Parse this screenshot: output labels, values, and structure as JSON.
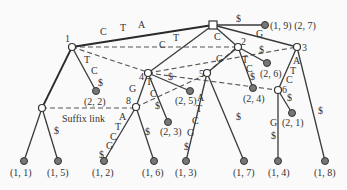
{
  "diagram": {
    "type": "generalized-suffix-tree",
    "root": {
      "id": "root",
      "shape": "square"
    },
    "internal_nodes": [
      {
        "id": "n1",
        "label": "1"
      },
      {
        "id": "n2",
        "label": "2"
      },
      {
        "id": "n3",
        "label": "3"
      },
      {
        "id": "n4",
        "label": "4"
      },
      {
        "id": "n5",
        "label": "5"
      },
      {
        "id": "n6",
        "label": "6"
      },
      {
        "id": "n8",
        "label": "8"
      },
      {
        "id": "nL",
        "label": ""
      }
    ],
    "leaves": [
      {
        "id": "l19",
        "label": "(1, 9) (2, 7)"
      },
      {
        "id": "l22",
        "label": "(2, 2)"
      },
      {
        "id": "l25",
        "label": "(2, 5)"
      },
      {
        "id": "l23",
        "label": "(2, 3)"
      },
      {
        "id": "l26",
        "label": "(2, 6)"
      },
      {
        "id": "l24",
        "label": "(2, 4)"
      },
      {
        "id": "l21",
        "label": "(2, 1)"
      },
      {
        "id": "l11",
        "label": "(1, 1)"
      },
      {
        "id": "l15",
        "label": "(1, 5)"
      },
      {
        "id": "l12",
        "label": "(1, 2)"
      },
      {
        "id": "l16",
        "label": "(1, 6)"
      },
      {
        "id": "l13",
        "label": "(1, 3)"
      },
      {
        "id": "l17",
        "label": "(1, 7)"
      },
      {
        "id": "l14",
        "label": "(1, 4)"
      },
      {
        "id": "l18",
        "label": "(1, 8)"
      }
    ],
    "edge_labels": {
      "root_n1": [
        "C",
        "T",
        "A"
      ],
      "root_l19": "$",
      "root_n4": [
        "C",
        "T"
      ],
      "root_n2": "C",
      "root_n3": "G",
      "n1_l22": [
        "T",
        "C",
        "$"
      ],
      "n4_l25": "$",
      "n4_n8": "G",
      "n4_l23": [
        "T",
        "C",
        "$"
      ],
      "n2_n5": "G",
      "n2_l26": "$",
      "n2_l24": [
        "T",
        "C",
        "$"
      ],
      "n3_n6": [
        "A",
        "T",
        "C"
      ],
      "n3_l18": "$",
      "n6_l21": "$",
      "n6_l14": [
        "G",
        "$"
      ],
      "nL_l15": "$",
      "n8_l12": [
        "A",
        "T",
        "C",
        "G",
        "$"
      ],
      "n8_l16": "$",
      "n5_l13": [
        "A",
        "T",
        "C",
        "G",
        "$"
      ],
      "n5_l17": "$"
    },
    "annotation": "Suffix link"
  }
}
